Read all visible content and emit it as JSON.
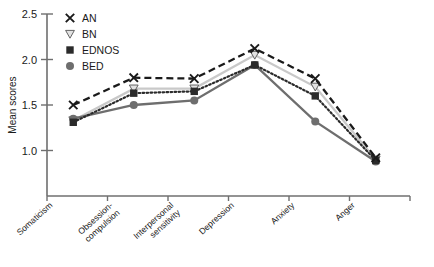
{
  "chart_data": {
    "type": "line",
    "title": "",
    "subtitle": "",
    "xlabel": "",
    "ylabel": "Mean scores",
    "categories": [
      "Somaticism",
      "Obsession-compulsion",
      "Interpersonal sensitivity",
      "Depression",
      "Anxiety",
      "Anger"
    ],
    "ylim": [
      0.5,
      2.5
    ],
    "yticks": [
      1.0,
      1.5,
      2.0,
      2.5
    ],
    "ytick_labels": [
      "1.0",
      "1.5",
      "2.0",
      "2.5"
    ],
    "grid": false,
    "legend_position": "top-left",
    "series": [
      {
        "name": "AN",
        "marker": "x",
        "line_style": "dashed",
        "color": "#1a1a1a",
        "values": [
          1.5,
          1.8,
          1.79,
          2.12,
          1.79,
          0.92
        ]
      },
      {
        "name": "BN",
        "marker": "triangle-down",
        "line_style": "solid",
        "color": "#c9c9c9",
        "values": [
          1.33,
          1.68,
          1.68,
          2.05,
          1.7,
          0.9
        ]
      },
      {
        "name": "EDNOS",
        "marker": "square",
        "line_style": "dotted",
        "color": "#2b2b2b",
        "values": [
          1.31,
          1.63,
          1.65,
          1.94,
          1.6,
          0.89
        ]
      },
      {
        "name": "BED",
        "marker": "circle",
        "line_style": "solid",
        "color": "#6e6e6e",
        "values": [
          1.35,
          1.5,
          1.55,
          1.94,
          1.32,
          0.88
        ]
      }
    ]
  },
  "legend": {
    "items": [
      {
        "label": "AN"
      },
      {
        "label": "BN"
      },
      {
        "label": "EDNOS"
      },
      {
        "label": "BED"
      }
    ]
  },
  "axes": {
    "y_title": "Mean scores"
  }
}
